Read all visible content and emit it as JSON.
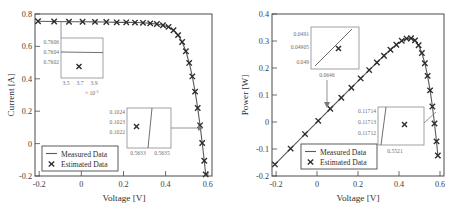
{
  "figure": {
    "panels": [
      {
        "id": "iv-curve",
        "ylabel": "Current [A]",
        "xlabel": "Voltage [V]",
        "legend": {
          "measured": "Measured Data",
          "estimated": "Estimated Data"
        },
        "insets": [
          {
            "id": "inset-isc",
            "ylabels": [
              "0.7606",
              "0.7604",
              "0.7602"
            ],
            "xlabels": [
              "3.5",
              "3.7",
              "3.9"
            ],
            "exponent": "× 10",
            "exponent_power": "-3"
          },
          {
            "id": "inset-knee",
            "ylabels": [
              "0.1024",
              "0.1023",
              "0.1022"
            ],
            "xlabels": [
              "0.5633",
              "0.5635"
            ],
            "exponent": "",
            "exponent_power": ""
          }
        ]
      },
      {
        "id": "pv-curve",
        "ylabel": "Power [W]",
        "xlabel": "Voltage [V]",
        "legend": {
          "measured": "Measured Data",
          "estimated": "Estimated Data"
        },
        "insets": [
          {
            "id": "inset-low-power",
            "ylabels": [
              "0.0491",
              "0.04905",
              "0.049"
            ],
            "xlabels": [
              "0.0646"
            ],
            "exponent": "",
            "exponent_power": ""
          },
          {
            "id": "inset-high-power",
            "ylabels": [
              "0.11714",
              "0.11713",
              "0.11712"
            ],
            "xlabels": [
              "0.5521"
            ],
            "exponent": "",
            "exponent_power": ""
          }
        ]
      }
    ]
  },
  "chart_data": [
    {
      "type": "line",
      "id": "iv-curve",
      "title": "",
      "xlabel": "Voltage [V]",
      "ylabel": "Current [A]",
      "xlim": [
        -0.22,
        0.62
      ],
      "ylim": [
        -0.22,
        0.81
      ],
      "xticks": [
        -0.2,
        0,
        0.2,
        0.4,
        0.6
      ],
      "xticklabels": [
        "-0.2",
        "0",
        "0.2",
        "0.4",
        "0.6"
      ],
      "yticks": [
        -0.2,
        0,
        0.2,
        0.4,
        0.6,
        0.8
      ],
      "yticklabels": [
        "-0.2",
        "0",
        "0.2",
        "0.4",
        "0.6",
        "0.8"
      ],
      "grid": false,
      "legend_position": "lower-left",
      "series": [
        {
          "name": "Measured Data",
          "style": "line",
          "x": [
            -0.2057,
            -0.1291,
            -0.0588,
            0.0057,
            0.0646,
            0.1185,
            0.1678,
            0.2132,
            0.2545,
            0.2924,
            0.3269,
            0.3585,
            0.3873,
            0.4137,
            0.4373,
            0.459,
            0.4784,
            0.496,
            0.5119,
            0.5265,
            0.5398,
            0.5521,
            0.5633,
            0.5736,
            0.5833,
            0.59,
            0.5943,
            0.5985
          ],
          "y": [
            0.764,
            0.762,
            0.7605,
            0.7605,
            0.76,
            0.759,
            0.757,
            0.757,
            0.7555,
            0.754,
            0.7505,
            0.7465,
            0.7385,
            0.728,
            0.7065,
            0.6755,
            0.632,
            0.573,
            0.499,
            0.413,
            0.3165,
            0.2122,
            0.1023,
            -0.01,
            -0.123,
            -0.21,
            -0.21,
            -0.21
          ]
        },
        {
          "name": "Estimated Data",
          "style": "x-marker",
          "x": [
            -0.2057,
            -0.1291,
            -0.0588,
            0.0057,
            0.0646,
            0.1185,
            0.1678,
            0.2132,
            0.2545,
            0.2924,
            0.3269,
            0.3585,
            0.3873,
            0.4137,
            0.4373,
            0.459,
            0.4784,
            0.496,
            0.5119,
            0.5265,
            0.5398,
            0.5521,
            0.5633,
            0.5736,
            0.5833,
            0.59
          ],
          "y": [
            0.764,
            0.762,
            0.7605,
            0.7605,
            0.76,
            0.759,
            0.757,
            0.757,
            0.7555,
            0.754,
            0.7505,
            0.7465,
            0.7385,
            0.728,
            0.7065,
            0.6755,
            0.632,
            0.573,
            0.499,
            0.413,
            0.3165,
            0.2122,
            0.1023,
            -0.01,
            -0.123,
            -0.21
          ]
        }
      ]
    },
    {
      "type": "line",
      "id": "pv-curve",
      "title": "",
      "xlabel": "Voltage [V]",
      "ylabel": "Power [W]",
      "xlim": [
        -0.22,
        0.62
      ],
      "ylim": [
        -0.2,
        0.4
      ],
      "xticks": [
        -0.2,
        0,
        0.2,
        0.4,
        0.6
      ],
      "xticklabels": [
        "-0.2",
        "0",
        "0.2",
        "0.4",
        "0.6"
      ],
      "yticks": [
        -0.2,
        -0.1,
        0,
        0.1,
        0.2,
        0.3,
        0.4
      ],
      "yticklabels": [
        "-0.2",
        "-0.1",
        "0",
        "0.1",
        "0.2",
        "0.3",
        "0.4"
      ],
      "grid": false,
      "legend_position": "lower-left",
      "series": [
        {
          "name": "Measured Data",
          "style": "line",
          "x": [
            -0.2057,
            -0.1291,
            -0.0588,
            0.0057,
            0.0646,
            0.1185,
            0.1678,
            0.2132,
            0.2545,
            0.2924,
            0.3269,
            0.3585,
            0.3873,
            0.4137,
            0.4373,
            0.459,
            0.4784,
            0.496,
            0.5119,
            0.5265,
            0.5398,
            0.5521,
            0.5633,
            0.5736,
            0.5833,
            0.59
          ],
          "y": [
            -0.1572,
            -0.0984,
            -0.0447,
            0.0043,
            0.0491,
            0.0899,
            0.127,
            0.1614,
            0.1923,
            0.2204,
            0.2454,
            0.2676,
            0.286,
            0.3011,
            0.309,
            0.3101,
            0.3024,
            0.2842,
            0.2554,
            0.2175,
            0.1708,
            0.1171,
            0.0576,
            -0.0057,
            -0.0717,
            -0.1239
          ]
        },
        {
          "name": "Estimated Data",
          "style": "x-marker",
          "x": [
            -0.2057,
            -0.1291,
            -0.0588,
            0.0057,
            0.0646,
            0.1185,
            0.1678,
            0.2132,
            0.2545,
            0.2924,
            0.3269,
            0.3585,
            0.3873,
            0.4137,
            0.4373,
            0.459,
            0.4784,
            0.496,
            0.5119,
            0.5265,
            0.5398,
            0.5521,
            0.5633,
            0.5736,
            0.5833,
            0.59
          ],
          "y": [
            -0.1572,
            -0.0984,
            -0.0447,
            0.0043,
            0.0491,
            0.0899,
            0.127,
            0.1614,
            0.1923,
            0.2204,
            0.2454,
            0.2676,
            0.286,
            0.3011,
            0.309,
            0.3101,
            0.3024,
            0.2842,
            0.2554,
            0.2175,
            0.1708,
            0.1171,
            0.0576,
            -0.0057,
            -0.0717,
            -0.1239
          ]
        }
      ]
    }
  ]
}
